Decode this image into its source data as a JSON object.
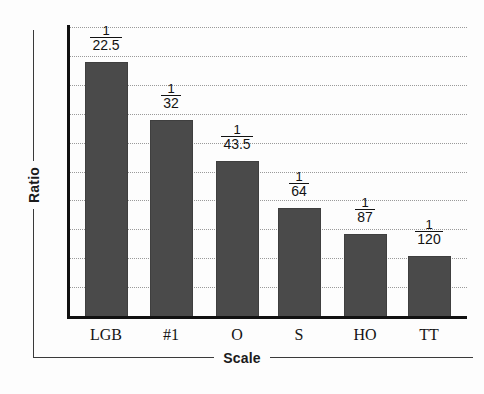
{
  "chart_data": {
    "type": "bar",
    "title": "",
    "subtitle": "",
    "xlabel": "Scale",
    "ylabel": "Ratio",
    "categories": [
      "LGB",
      "#1",
      "O",
      "S",
      "HO",
      "TT"
    ],
    "value_labels": [
      {
        "numerator": "1",
        "denominator": "22.5"
      },
      {
        "numerator": "1",
        "denominator": "32"
      },
      {
        "numerator": "1",
        "denominator": "43.5"
      },
      {
        "numerator": "1",
        "denominator": "64"
      },
      {
        "numerator": "1",
        "denominator": "87"
      },
      {
        "numerator": "1",
        "denominator": "120"
      }
    ],
    "values": [
      0.04444,
      0.03125,
      0.02299,
      0.015625,
      0.011494,
      0.008333
    ],
    "denominators": [
      22.5,
      32,
      43.5,
      64,
      87,
      120
    ],
    "bar_pixel_heights": [
      256,
      198,
      157,
      110,
      84,
      62
    ],
    "ylim": [
      0,
      0.0472
    ],
    "grid": true,
    "gridline_count": 10,
    "legend": "none",
    "bar_color": "#4a4a4a",
    "axis_color": "#111111",
    "grid_color": "#9a9a9a"
  },
  "axes": {
    "y_title": "Ratio",
    "x_title": "Scale"
  }
}
